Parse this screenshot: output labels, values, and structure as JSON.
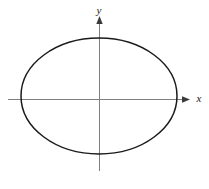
{
  "figure": {
    "title": "",
    "background_color": "#ffffff",
    "width": 209,
    "height": 189
  },
  "axes": {
    "x_axis": {
      "label": "x",
      "color": "#808080",
      "arrow": "right-arrow",
      "origin_x": 99,
      "origin_y": 99,
      "start_x": 8,
      "end_x": 190,
      "label_x": 199,
      "label_y": 102
    },
    "y_axis": {
      "label": "y",
      "color": "#808080",
      "arrow": "up-arrow",
      "origin_x": 99,
      "origin_y": 99,
      "start_y": 171,
      "end_y": 16,
      "label_x": 99,
      "label_y": 14
    }
  },
  "chart_data": {
    "type": "line",
    "title": "",
    "xlabel": "x",
    "ylabel": "y",
    "grid": false,
    "legend": null,
    "curves": [
      {
        "name": "ellipse",
        "shape": "ellipse",
        "color": "#1a1a1a",
        "stroke_width": 1.5,
        "fill": "none",
        "center_x": 99,
        "center_y": 96,
        "semi_axis_x": 78,
        "semi_axis_y": 58,
        "x_intercepts": [
          -78,
          78
        ],
        "y_intercepts": [
          -58,
          58
        ]
      }
    ],
    "xlim": [
      -99,
      110
    ],
    "ylim": [
      -72,
      99
    ]
  }
}
